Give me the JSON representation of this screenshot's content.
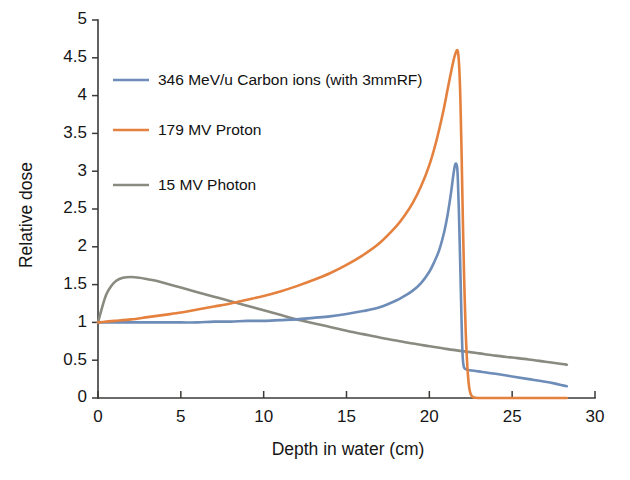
{
  "chart_data": {
    "type": "line",
    "title": "",
    "xlabel": "Depth in water (cm)",
    "ylabel": "Relative dose",
    "xlim": [
      0,
      30
    ],
    "ylim": [
      0,
      5
    ],
    "xticks": [
      0,
      5,
      10,
      15,
      20,
      25,
      30
    ],
    "xtick_labels": [
      "0",
      "5",
      "10",
      "15",
      "20",
      "25",
      "30"
    ],
    "yticks": [
      0,
      0.5,
      1,
      1.5,
      2,
      2.5,
      3,
      3.5,
      4,
      4.5,
      5
    ],
    "ytick_labels": [
      "0",
      "0.5",
      "1",
      "1.5",
      "2",
      "2.5",
      "3",
      "3.5",
      "4",
      "4.5",
      "5"
    ],
    "grid": false,
    "legend_position": "upper-left",
    "series": [
      {
        "name": "346 MeV/u Carbon ions (with 3mmRF)",
        "color": "#6d8cb8",
        "x": [
          0,
          0.5,
          1,
          2,
          3,
          4,
          5,
          6,
          7,
          8,
          9,
          10,
          11,
          12,
          13,
          14,
          15,
          16,
          17,
          18,
          18.5,
          19,
          19.5,
          20,
          20.3,
          20.6,
          20.9,
          21.1,
          21.3,
          21.45,
          21.55,
          21.62,
          21.68,
          21.72,
          21.78,
          21.85,
          21.92,
          21.97,
          22.02,
          22.1,
          22.3,
          22.7,
          23.2,
          24,
          25,
          26,
          27,
          27.6,
          28,
          28.3
        ],
        "y": [
          1.0,
          1.0,
          1.0,
          1.0,
          1.0,
          1.0,
          1.0,
          1.0,
          1.01,
          1.01,
          1.02,
          1.02,
          1.03,
          1.04,
          1.06,
          1.08,
          1.11,
          1.15,
          1.2,
          1.29,
          1.35,
          1.42,
          1.52,
          1.67,
          1.8,
          1.96,
          2.2,
          2.42,
          2.7,
          2.95,
          3.08,
          3.1,
          3.05,
          2.9,
          2.5,
          1.9,
          1.25,
          0.8,
          0.52,
          0.4,
          0.375,
          0.36,
          0.345,
          0.32,
          0.285,
          0.25,
          0.215,
          0.19,
          0.17,
          0.155
        ]
      },
      {
        "name": "179 MV Proton",
        "color": "#e4813f",
        "x": [
          0,
          0.5,
          1,
          2,
          3,
          4,
          5,
          6,
          7,
          8,
          9,
          10,
          11,
          12,
          13,
          14,
          15,
          16,
          17,
          18,
          18.5,
          19,
          19.5,
          20,
          20.4,
          20.8,
          21.1,
          21.3,
          21.5,
          21.62,
          21.7,
          21.76,
          21.82,
          21.88,
          21.95,
          22.02,
          22.1,
          22.2,
          22.3,
          22.4,
          22.5,
          22.65,
          23,
          24,
          26,
          28,
          28.3
        ],
        "y": [
          1.0,
          1.01,
          1.02,
          1.04,
          1.07,
          1.1,
          1.13,
          1.17,
          1.21,
          1.25,
          1.3,
          1.35,
          1.41,
          1.48,
          1.56,
          1.65,
          1.76,
          1.89,
          2.05,
          2.27,
          2.41,
          2.58,
          2.8,
          3.08,
          3.38,
          3.75,
          4.08,
          4.3,
          4.5,
          4.58,
          4.6,
          4.52,
          4.3,
          3.9,
          3.2,
          2.4,
          1.6,
          0.85,
          0.4,
          0.15,
          0.05,
          0.01,
          0.0,
          0.0,
          0.0,
          0.0,
          0.0
        ]
      },
      {
        "name": "15 MV Photon",
        "color": "#8a8a80",
        "x": [
          0,
          0.25,
          0.5,
          0.8,
          1.1,
          1.5,
          2,
          2.5,
          3,
          3.5,
          4,
          5,
          6,
          7,
          8,
          9,
          10,
          11,
          12,
          13,
          14,
          15,
          16,
          17,
          18,
          19,
          20,
          21,
          22,
          23,
          24,
          25,
          26,
          27,
          28,
          28.3
        ],
        "y": [
          1.0,
          1.2,
          1.37,
          1.48,
          1.55,
          1.59,
          1.6,
          1.59,
          1.57,
          1.55,
          1.52,
          1.46,
          1.4,
          1.34,
          1.28,
          1.22,
          1.16,
          1.1,
          1.04,
          0.99,
          0.94,
          0.89,
          0.845,
          0.8,
          0.76,
          0.72,
          0.685,
          0.65,
          0.62,
          0.59,
          0.56,
          0.535,
          0.51,
          0.48,
          0.45,
          0.44
        ]
      }
    ]
  },
  "legend": {
    "entries": [
      {
        "label": "346 MeV/u Carbon ions (with 3mmRF)",
        "color": "#6d8cb8"
      },
      {
        "label": "179 MV Proton",
        "color": "#e4813f"
      },
      {
        "label": "15 MV Photon",
        "color": "#8a8a80"
      }
    ]
  },
  "axes": {
    "x_title": "Depth in water (cm)",
    "y_title": "Relative dose"
  }
}
